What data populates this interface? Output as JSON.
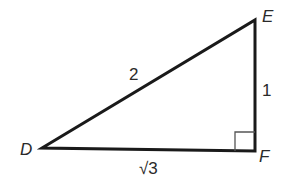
{
  "diagram": {
    "type": "right-triangle",
    "vertices": {
      "D": {
        "label": "D",
        "x": 42,
        "y": 148
      },
      "E": {
        "label": "E",
        "x": 255,
        "y": 20
      },
      "F": {
        "label": "F",
        "x": 255,
        "y": 151
      }
    },
    "sides": {
      "DE": {
        "label": "2"
      },
      "EF": {
        "label": "1"
      },
      "DF": {
        "label": "√3"
      }
    },
    "right_angle_at": "F",
    "stroke_color": "#1a1a1a"
  }
}
